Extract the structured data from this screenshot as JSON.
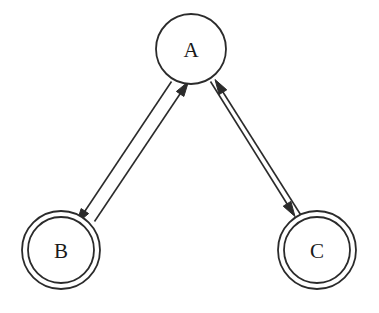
{
  "diagram": {
    "type": "state-transition-diagram",
    "background_color": "#ffffff",
    "stroke_color": "#2b2b2b",
    "label_color": "#1a1a1a",
    "fill_color": "#ffffff",
    "node_stroke_width": 1.8,
    "edge_stroke_width": 1.6,
    "label_font_size": 21,
    "nodes": [
      {
        "id": "A",
        "label": "A",
        "shape": "circle",
        "accepting": false,
        "cx": 191,
        "cy": 49,
        "r_outer": 35,
        "r_inner": 0
      },
      {
        "id": "B",
        "label": "B",
        "shape": "double-circle",
        "accepting": true,
        "cx": 61,
        "cy": 250,
        "r_outer": 39,
        "r_inner": 33
      },
      {
        "id": "C",
        "label": "C",
        "shape": "double-circle",
        "accepting": true,
        "cx": 317,
        "cy": 250,
        "r_outer": 39,
        "r_inner": 33
      }
    ],
    "edges": [
      {
        "id": "A-to-B",
        "from": "A",
        "to": "B",
        "label": "",
        "directed": true,
        "line": {
          "x1": 171.5,
          "y1": 81.5,
          "x2": 83.0,
          "y2": 214.0
        },
        "arrow": {
          "tip_x": 76.5,
          "tip_y": 223.5,
          "angle_deg": 124.0
        }
      },
      {
        "id": "B-to-A",
        "from": "B",
        "to": "A",
        "label": "",
        "directed": true,
        "line": {
          "x1": 94.5,
          "y1": 221.5,
          "x2": 182.0,
          "y2": 91.0
        },
        "arrow": {
          "tip_x": 188.5,
          "tip_y": 81.5,
          "angle_deg": -56.0
        }
      },
      {
        "id": "A-to-C",
        "from": "A",
        "to": "C",
        "label": "",
        "directed": true,
        "line": {
          "x1": 210.5,
          "y1": 81.5,
          "x2": 289.0,
          "y2": 207.0
        },
        "arrow": {
          "tip_x": 295.0,
          "tip_y": 216.5,
          "angle_deg": 58.0
        }
      },
      {
        "id": "C-to-A",
        "from": "C",
        "to": "A",
        "label": "",
        "directed": true,
        "line": {
          "x1": 300.5,
          "y1": 214.5,
          "x2": 221.0,
          "y2": 89.0
        },
        "arrow": {
          "tip_x": 215.0,
          "tip_y": 79.5,
          "angle_deg": -122.0
        }
      }
    ],
    "arrow_head_length": 15,
    "arrow_head_width": 9
  }
}
